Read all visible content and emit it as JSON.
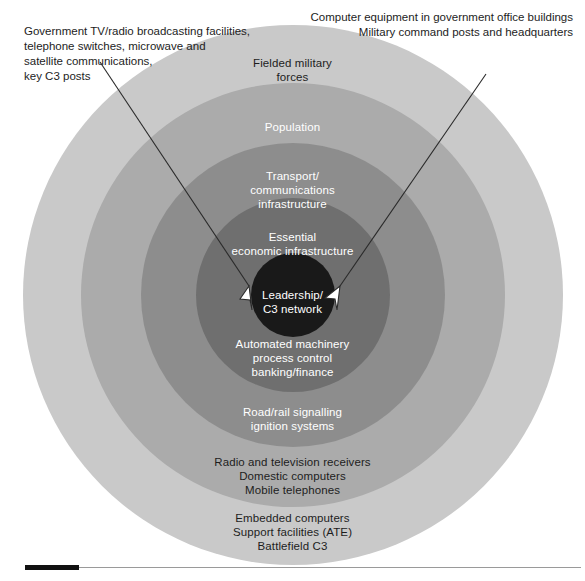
{
  "diagram": {
    "center_x": 293,
    "center_y": 295,
    "colors": {
      "background": "#ffffff",
      "ring_1_outer": "#c9c9c9",
      "ring_2": "#ababab",
      "ring_3": "#8d8d8d",
      "ring_4": "#6f6f6f",
      "ring_5": "#4b4b4b",
      "ring_6_core": "#191919",
      "text_dark": "#1d1d1d",
      "text_light": "#ffffff",
      "rule_line": "#9a9a9a",
      "rule_tab": "#111111",
      "arrow_fill": "#ffffff",
      "arrow_stroke": "#2a2a2a"
    },
    "rings": [
      {
        "id": "ring-1",
        "name": "embedded-computers-ring",
        "label": "Embedded computers\nSupport facilities (ATE)\nBattlefield C3",
        "label_color": "dark",
        "fill": "#c9c9c9",
        "radius": 270
      },
      {
        "id": "ring-2",
        "name": "fielded-military-forces-ring",
        "label": "Fielded military\nforces",
        "label_color": "dark",
        "fill": "#c9c9c9",
        "radius": 270
      },
      {
        "id": "ring-3",
        "name": "consumer-electronics-ring",
        "label": "Radio and television receivers\nDomestic computers\nMobile telephones",
        "label_color": "dark",
        "fill": "#ababab",
        "radius": 212
      },
      {
        "id": "ring-4",
        "name": "population-ring",
        "label": "Population",
        "label_color": "light",
        "fill": "#ababab",
        "radius": 212
      },
      {
        "id": "ring-5",
        "name": "signalling-ignition-ring",
        "label": "Road/rail signalling\nignition systems",
        "label_color": "light",
        "fill": "#8d8d8d",
        "radius": 152
      },
      {
        "id": "ring-6",
        "name": "transport-communications-ring",
        "label": "Transport/\ncommunications\ninfrastructure",
        "label_color": "light",
        "fill": "#8d8d8d",
        "radius": 152
      },
      {
        "id": "ring-7",
        "name": "automated-machinery-ring",
        "label": "Automated machinery\nprocess control\nbanking/finance",
        "label_color": "light",
        "fill": "#6f6f6f",
        "radius": 97
      },
      {
        "id": "ring-8",
        "name": "essential-economic-infrastructure-ring",
        "label": "Essential\neconomic infrastructure",
        "label_color": "light",
        "fill": "#6f6f6f",
        "radius": 97
      },
      {
        "id": "ring-9",
        "name": "leadership-c3-core",
        "label": "Leadership/\nC3 network",
        "label_color": "light",
        "fill": "#191919",
        "radius": 42
      }
    ],
    "annotations": [
      {
        "name": "annotation-left",
        "text": "Government TV/radio broadcasting facilities,\ntelephone switches, microwave and\nsatellite communications,\nkey C3 posts",
        "align": "left",
        "arrow": {
          "from_x": 100,
          "from_y": 62,
          "to_x": 256,
          "to_y": 298
        }
      },
      {
        "name": "annotation-right",
        "text": "Computer equipment in government office buildings\nMilitary command posts and headquarters",
        "align": "right",
        "arrow": {
          "from_x": 486,
          "from_y": 74,
          "to_x": 333,
          "to_y": 298
        }
      }
    ],
    "footer_rule": {
      "name": "footer-rule",
      "tab_width": 54,
      "line_width": 556
    }
  }
}
